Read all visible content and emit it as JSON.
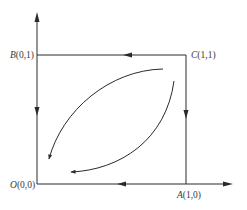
{
  "diagram": {
    "type": "phase-path-diagram",
    "colors": {
      "line": "#2a2a2a",
      "label": "#3a3a3a",
      "background": "#ffffff"
    },
    "points": [
      {
        "id": "O",
        "letter": "O",
        "coords": "(0,0)",
        "px": [
          37,
          184
        ]
      },
      {
        "id": "A",
        "letter": "A",
        "coords": "(1,0)",
        "px": [
          186,
          184
        ]
      },
      {
        "id": "B",
        "letter": "B",
        "coords": "(0,1)",
        "px": [
          37,
          55
        ]
      },
      {
        "id": "C",
        "letter": "C",
        "coords": "(1,1)",
        "px": [
          186,
          55
        ]
      }
    ],
    "axes": {
      "x_axis": {
        "from": [
          37,
          184
        ],
        "to": [
          233,
          184
        ],
        "arrow": "right"
      },
      "y_axis": {
        "from": [
          37,
          184
        ],
        "to": [
          37,
          12
        ],
        "arrow": "up"
      }
    },
    "edges": [
      {
        "from": "C",
        "to": "B",
        "direction": "left"
      },
      {
        "from": "B",
        "to": "O",
        "direction": "down"
      },
      {
        "from": "C",
        "to": "A",
        "direction": "down"
      },
      {
        "from": "A",
        "to": "O",
        "direction": "left"
      }
    ],
    "curves": [
      {
        "name": "upper-curve",
        "description": "arc from near C bending up-left toward O",
        "arrow": "down-left"
      },
      {
        "name": "lower-curve",
        "description": "arc from near C bending down-right toward O",
        "arrow": "left"
      }
    ]
  }
}
